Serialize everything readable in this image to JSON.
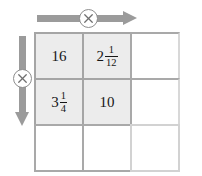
{
  "diagram": {
    "colors": {
      "filled_cell": "#ececec",
      "empty_cell": "#ffffff",
      "grid_line": "#a9a9a9",
      "arrow": "#9b9b9b",
      "operator_stroke": "#8e8e8e",
      "text": "#161616"
    },
    "grid": {
      "rows": 3,
      "columns": 3,
      "cells": [
        [
          {
            "name": "cell-r1c1",
            "filled": true,
            "type": "integer",
            "value": "16",
            "whole": "16",
            "numerator": "",
            "denominator": ""
          },
          {
            "name": "cell-r1c2",
            "filled": true,
            "type": "mixed",
            "value": "2 1/12",
            "whole": "2",
            "numerator": "1",
            "denominator": "12"
          },
          {
            "name": "cell-r1c3",
            "filled": false,
            "type": "empty",
            "value": "",
            "whole": "",
            "numerator": "",
            "denominator": ""
          }
        ],
        [
          {
            "name": "cell-r2c1",
            "filled": true,
            "type": "mixed",
            "value": "3 1/4",
            "whole": "3",
            "numerator": "1",
            "denominator": "4"
          },
          {
            "name": "cell-r2c2",
            "filled": true,
            "type": "integer",
            "value": "10",
            "whole": "10",
            "numerator": "",
            "denominator": ""
          },
          {
            "name": "cell-r2c3",
            "filled": false,
            "type": "empty",
            "value": "",
            "whole": "",
            "numerator": "",
            "denominator": ""
          }
        ],
        [
          {
            "name": "cell-r3c1",
            "filled": false,
            "type": "empty",
            "value": "",
            "whole": "",
            "numerator": "",
            "denominator": ""
          },
          {
            "name": "cell-r3c2",
            "filled": false,
            "type": "empty",
            "value": "",
            "whole": "",
            "numerator": "",
            "denominator": ""
          },
          {
            "name": "cell-r3c3",
            "filled": false,
            "type": "empty",
            "value": "",
            "whole": "",
            "numerator": "",
            "denominator": ""
          }
        ]
      ]
    },
    "arrows": {
      "top": {
        "name": "row-direction-arrow",
        "direction": "right",
        "operator_symbol": "×",
        "operator_label": "multiply"
      },
      "left": {
        "name": "column-direction-arrow",
        "direction": "down",
        "operator_symbol": "×",
        "operator_label": "multiply"
      }
    }
  }
}
